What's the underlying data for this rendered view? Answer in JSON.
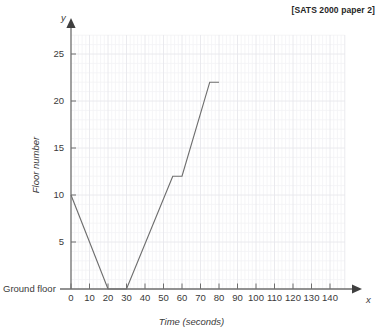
{
  "source_note": "[SATS 2000 paper 2]",
  "axes": {
    "x_axis_letter": "x",
    "y_axis_letter": "y",
    "origin_label": "Ground floor"
  },
  "chart_data": {
    "type": "line",
    "title": "",
    "subtitle": "",
    "xlabel": "Time (seconds)",
    "ylabel": "Floor number",
    "xlim": [
      0,
      140
    ],
    "ylim": [
      0,
      27
    ],
    "xticks": [
      0,
      10,
      20,
      30,
      40,
      50,
      60,
      70,
      80,
      90,
      100,
      110,
      120,
      130,
      140
    ],
    "xtick_labels": [
      "0",
      "10",
      "20",
      "30",
      "40",
      "50",
      "60",
      "70",
      "80",
      "90",
      "100",
      "110",
      "120",
      "130",
      "140"
    ],
    "yticks": [
      5,
      10,
      15,
      20,
      25
    ],
    "ytick_labels": [
      "5",
      "10",
      "15",
      "20",
      "25"
    ],
    "y_zero_label": "Ground floor",
    "grid": true,
    "grid_major_x_step": 10,
    "grid_major_y_step": 5,
    "grid_minor_x_step": 2,
    "grid_minor_y_step": 1,
    "legend": false,
    "series": [
      {
        "name": "Lift journey",
        "color": "#6e6e6e",
        "x": [
          0,
          20,
          30,
          55,
          60,
          75,
          80
        ],
        "y": [
          10,
          0,
          0,
          12,
          12,
          22,
          22
        ],
        "points": [
          {
            "x": 0,
            "y": 10
          },
          {
            "x": 20,
            "y": 0
          },
          {
            "x": 30,
            "y": 0
          },
          {
            "x": 55,
            "y": 12
          },
          {
            "x": 60,
            "y": 12
          },
          {
            "x": 75,
            "y": 22
          },
          {
            "x": 80,
            "y": 22
          }
        ]
      }
    ]
  },
  "colors": {
    "line": "#6e6e6e",
    "axis": "#6e6e6e",
    "grid_minor": "#f2f2f4",
    "grid_major": "#ebebef",
    "text": "#3a3a3a",
    "note": "#262626",
    "background": "#ffffff"
  }
}
